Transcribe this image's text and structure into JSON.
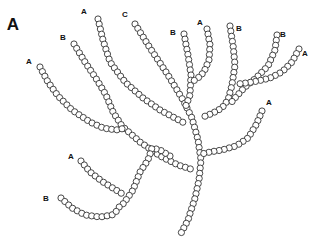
{
  "figure": {
    "panel_label": "A",
    "bead_radius": 3.1,
    "bead_spacing": 5.2,
    "colors": {
      "bead_stroke": "#333333",
      "bead_fill": "#ffffff",
      "text": "#111111"
    }
  },
  "labels": [
    {
      "text": "A",
      "x": 13,
      "y": 30,
      "kind": "panel"
    },
    {
      "text": "A",
      "x": 29,
      "y": 64,
      "kind": "end"
    },
    {
      "text": "B",
      "x": 63,
      "y": 40,
      "kind": "end"
    },
    {
      "text": "A",
      "x": 84,
      "y": 14,
      "kind": "end"
    },
    {
      "text": "C",
      "x": 125,
      "y": 17,
      "kind": "end"
    },
    {
      "text": "B",
      "x": 173,
      "y": 35,
      "kind": "end"
    },
    {
      "text": "A",
      "x": 200,
      "y": 25,
      "kind": "end"
    },
    {
      "text": "B",
      "x": 239,
      "y": 31,
      "kind": "end"
    },
    {
      "text": "B",
      "x": 283,
      "y": 37,
      "kind": "end"
    },
    {
      "text": "A",
      "x": 305,
      "y": 56,
      "kind": "end"
    },
    {
      "text": "A",
      "x": 269,
      "y": 105,
      "kind": "end"
    },
    {
      "text": "A",
      "x": 71,
      "y": 159,
      "kind": "end"
    },
    {
      "text": "B",
      "x": 46,
      "y": 201,
      "kind": "end"
    }
  ],
  "chains": [
    {
      "name": "chain-c-trunk",
      "points": [
        [
          135,
          24
        ],
        [
          150,
          48
        ],
        [
          168,
          75
        ],
        [
          183,
          100
        ],
        [
          192,
          118
        ],
        [
          198,
          140
        ],
        [
          201,
          160
        ],
        [
          199,
          180
        ],
        [
          195,
          198
        ],
        [
          188,
          220
        ],
        [
          179,
          237
        ]
      ]
    },
    {
      "name": "chain-b-top-center",
      "points": [
        [
          184,
          34
        ],
        [
          188,
          55
        ],
        [
          191,
          75
        ],
        [
          190,
          95
        ],
        [
          185,
          108
        ]
      ]
    },
    {
      "name": "chain-a-top-center",
      "points": [
        [
          207,
          29
        ],
        [
          210,
          45
        ],
        [
          209,
          60
        ],
        [
          204,
          72
        ],
        [
          198,
          78
        ],
        [
          192,
          82
        ]
      ]
    },
    {
      "name": "chain-b-right-vertical",
      "points": [
        [
          230,
          26
        ],
        [
          233,
          45
        ],
        [
          235,
          65
        ],
        [
          232,
          85
        ],
        [
          228,
          100
        ],
        [
          222,
          108
        ],
        [
          213,
          113
        ],
        [
          203,
          117
        ]
      ]
    },
    {
      "name": "chain-b-far-right",
      "points": [
        [
          277,
          35
        ],
        [
          275,
          50
        ],
        [
          268,
          66
        ],
        [
          256,
          78
        ],
        [
          244,
          88
        ],
        [
          235,
          98
        ],
        [
          230,
          104
        ]
      ]
    },
    {
      "name": "chain-a-far-right",
      "points": [
        [
          299,
          49
        ],
        [
          292,
          62
        ],
        [
          282,
          72
        ],
        [
          270,
          78
        ],
        [
          258,
          81
        ],
        [
          246,
          83
        ],
        [
          238,
          84
        ]
      ]
    },
    {
      "name": "chain-a-lower-right",
      "points": [
        [
          262,
          111
        ],
        [
          256,
          125
        ],
        [
          248,
          138
        ],
        [
          236,
          146
        ],
        [
          222,
          150
        ],
        [
          210,
          152
        ],
        [
          202,
          154
        ]
      ]
    },
    {
      "name": "chain-a-upper-mid",
      "points": [
        [
          98,
          19
        ],
        [
          103,
          40
        ],
        [
          110,
          62
        ],
        [
          125,
          82
        ],
        [
          143,
          98
        ],
        [
          160,
          110
        ],
        [
          175,
          118
        ],
        [
          186,
          124
        ]
      ]
    },
    {
      "name": "chain-b-left",
      "points": [
        [
          74,
          44
        ],
        [
          85,
          62
        ],
        [
          97,
          80
        ],
        [
          106,
          95
        ],
        [
          113,
          112
        ],
        [
          122,
          126
        ],
        [
          140,
          142
        ],
        [
          160,
          156
        ],
        [
          178,
          165
        ],
        [
          194,
          170
        ]
      ]
    },
    {
      "name": "chain-a-far-left",
      "points": [
        [
          40,
          67
        ],
        [
          48,
          82
        ],
        [
          58,
          96
        ],
        [
          72,
          110
        ],
        [
          90,
          122
        ],
        [
          103,
          128
        ],
        [
          116,
          130
        ],
        [
          126,
          128
        ]
      ]
    },
    {
      "name": "chain-lower-trunk",
      "points": [
        [
          170,
          156
        ],
        [
          160,
          150
        ],
        [
          152,
          148
        ],
        [
          148,
          160
        ],
        [
          140,
          172
        ],
        [
          133,
          190
        ],
        [
          124,
          203
        ],
        [
          118,
          208
        ]
      ]
    },
    {
      "name": "chain-a-lower-left",
      "points": [
        [
          81,
          161
        ],
        [
          90,
          172
        ],
        [
          103,
          182
        ],
        [
          116,
          190
        ],
        [
          124,
          195
        ]
      ]
    },
    {
      "name": "chain-b-lower-left",
      "points": [
        [
          61,
          198
        ],
        [
          72,
          208
        ],
        [
          85,
          215
        ],
        [
          100,
          217
        ],
        [
          112,
          215
        ],
        [
          119,
          209
        ]
      ]
    }
  ]
}
